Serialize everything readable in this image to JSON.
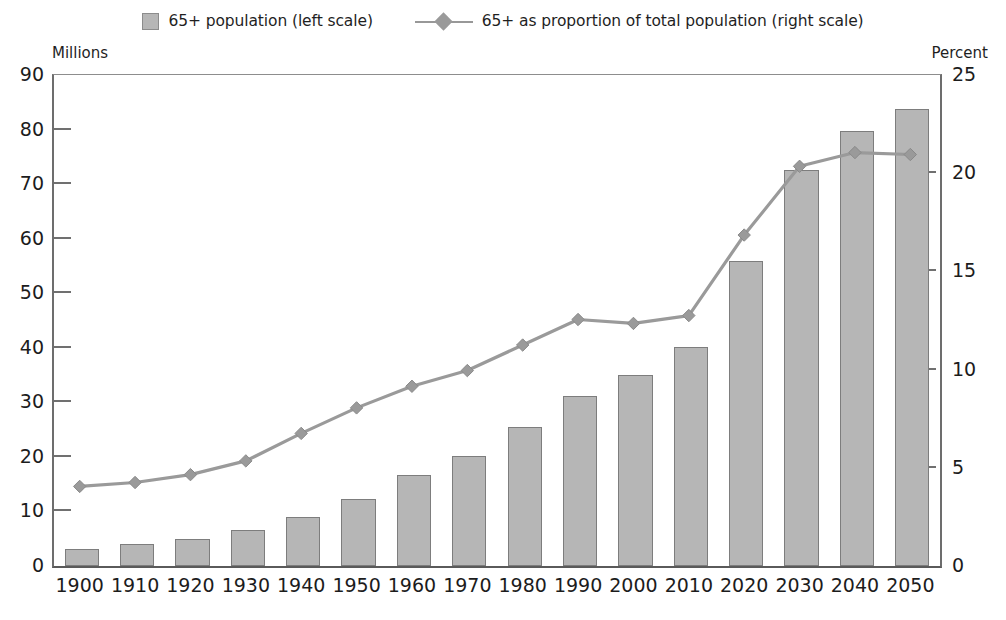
{
  "legend": {
    "items": [
      {
        "label": "65+ population (left scale)",
        "marker": "bar-swatch-icon",
        "color": "#b6b6b6"
      },
      {
        "label": "65+ as proportion of total population (right scale)",
        "marker": "line-diamond-icon",
        "color": "#9a9a9a"
      }
    ]
  },
  "axes": {
    "left_caption": "Millions",
    "right_caption": "Percent"
  },
  "chart_data": {
    "type": "bar",
    "title": "",
    "subtitle": "",
    "xlabel": "",
    "ylabel": "Millions",
    "y2label": "Percent",
    "grid": false,
    "legend_position": "top-center",
    "categories": [
      "1900",
      "1910",
      "1920",
      "1930",
      "1940",
      "1950",
      "1960",
      "1970",
      "1980",
      "1990",
      "2000",
      "2010",
      "2020",
      "2030",
      "2040",
      "2050"
    ],
    "ylim": [
      0,
      90
    ],
    "yticks": [
      0,
      10,
      20,
      30,
      40,
      50,
      60,
      70,
      80,
      90
    ],
    "y2lim": [
      0,
      25
    ],
    "y2ticks": [
      0,
      5,
      10,
      15,
      20,
      25
    ],
    "series": [
      {
        "name": "65+ population (left scale)",
        "type": "bar",
        "axis": "left",
        "units": "millions",
        "color": "#b6b6b6",
        "edge_color": "#7d7d7d",
        "values": [
          3.1,
          4.0,
          4.9,
          6.6,
          9.0,
          12.3,
          16.6,
          20.1,
          25.5,
          31.1,
          35.0,
          40.2,
          55.9,
          72.6,
          79.7,
          83.7
        ]
      },
      {
        "name": "65+ as proportion of total population (right scale)",
        "type": "line",
        "axis": "right",
        "units": "percent",
        "color": "#9a9a9a",
        "marker": "diamond",
        "values": [
          4.0,
          4.2,
          4.6,
          5.3,
          6.7,
          8.0,
          9.1,
          9.9,
          11.2,
          12.5,
          12.3,
          12.7,
          16.8,
          20.3,
          21.0,
          20.9
        ]
      }
    ]
  }
}
